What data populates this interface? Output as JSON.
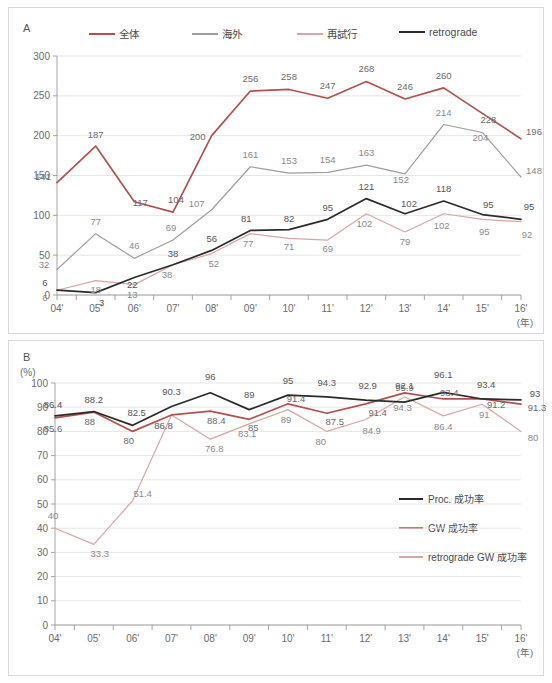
{
  "panelA": {
    "letter": "A",
    "legend": [
      {
        "label": "全体",
        "color": "#b5504e"
      },
      {
        "label": "海外",
        "color": "#9e9e9e"
      },
      {
        "label": "再試行",
        "color": "#d8a7a5"
      },
      {
        "label": "retrograde",
        "color": "#2b2b2b"
      }
    ],
    "axis_unit": "(年)"
  },
  "panelB": {
    "letter": "B",
    "unit": "(%)",
    "legend": [
      {
        "label": "Proc. 成功率",
        "color": "#2b2b2b"
      },
      {
        "label": "GW 成功率",
        "color": "#b5504e"
      },
      {
        "label": "retrograde GW 成功率",
        "color": "#d8a7a5"
      }
    ],
    "axis_unit": "(年)"
  },
  "chart_data": [
    {
      "type": "line",
      "panel": "A",
      "title": "",
      "xlabel": "(年)",
      "ylabel": "",
      "ylim": [
        0,
        300
      ],
      "yticks": [
        0,
        50,
        100,
        150,
        200,
        250,
        300
      ],
      "grid": true,
      "legend_position": "top",
      "categories": [
        "04'",
        "05'",
        "06'",
        "07'",
        "08'",
        "09'",
        "10'",
        "11'",
        "12'",
        "13'",
        "14'",
        "15'",
        "16'"
      ],
      "series": [
        {
          "name": "全体",
          "color": "#b5504e",
          "values": [
            141,
            187,
            117,
            104,
            200,
            256,
            258,
            247,
            268,
            246,
            260,
            228,
            196
          ]
        },
        {
          "name": "海外",
          "color": "#9e9e9e",
          "values": [
            32,
            77,
            46,
            69,
            107,
            161,
            153,
            154,
            163,
            152,
            214,
            204,
            148
          ]
        },
        {
          "name": "再試行",
          "color": "#d8a7a5",
          "values": [
            6,
            18,
            13,
            38,
            52,
            77,
            71,
            69,
            102,
            79,
            102,
            95,
            92
          ]
        },
        {
          "name": "retrograde",
          "color": "#2b2b2b",
          "values": [
            6,
            3,
            22,
            38,
            56,
            81,
            82,
            95,
            121,
            102,
            118,
            101,
            95
          ]
        }
      ],
      "labels": {
        "全体": [
          "141",
          "187",
          "117",
          "104",
          "200",
          "256",
          "258",
          "247",
          "268",
          "246",
          "260",
          "228",
          "196"
        ],
        "海外": [
          "32",
          "77",
          "46",
          "69",
          "107",
          "161",
          "153",
          "154",
          "163",
          "152",
          "214",
          "204",
          "148"
        ],
        "再試行": [
          "6",
          "18",
          "13",
          "38",
          "52",
          "77",
          "71",
          "69",
          "102",
          "79",
          "102",
          "95",
          "92"
        ],
        "retrograde": [
          "6",
          "3",
          "22",
          "38",
          "56",
          "81",
          "82",
          "95",
          "121",
          "102",
          "118",
          "95",
          "95"
        ]
      }
    },
    {
      "type": "line",
      "panel": "B",
      "title": "",
      "xlabel": "(年)",
      "ylabel": "(%)",
      "ylim": [
        0,
        100
      ],
      "yticks": [
        0,
        10,
        20,
        30,
        40,
        50,
        60,
        70,
        80,
        90,
        100
      ],
      "grid": true,
      "legend_position": "inside-right",
      "categories": [
        "04'",
        "05'",
        "06'",
        "07'",
        "08'",
        "09'",
        "10'",
        "11'",
        "12'",
        "13'",
        "14'",
        "15'",
        "16'"
      ],
      "series": [
        {
          "name": "Proc. 成功率",
          "color": "#2b2b2b",
          "values": [
            86.4,
            88.2,
            82.5,
            90.3,
            96,
            89,
            95,
            94.3,
            92.9,
            92.1,
            96.1,
            93.4,
            93
          ]
        },
        {
          "name": "GW 成功率",
          "color": "#b5504e",
          "values": [
            85.6,
            88,
            80,
            86.8,
            88.4,
            85,
            91.4,
            87.5,
            91.4,
            95.9,
            93.4,
            93.4,
            91.3
          ]
        },
        {
          "name": "retrograde GW 成功率",
          "color": "#d8a7a5",
          "values": [
            40,
            33.3,
            51.4,
            86.8,
            76.8,
            83.1,
            89,
            80,
            84.9,
            94.3,
            86.4,
            91.2,
            80
          ]
        }
      ],
      "labels": {
        "Proc. 成功率": [
          "86.4",
          "88.2",
          "82.5",
          "90.3",
          "96",
          "89",
          "95",
          "94.3",
          "92.9",
          "92.1",
          "96.1",
          "93.4",
          "93"
        ],
        "GW 成功率": [
          "85.6",
          "88",
          "80",
          "86.8",
          "88.4",
          "85",
          "91.4",
          "87.5",
          "91.4",
          "95.9",
          "93.4",
          "91.2",
          "91.3"
        ],
        "retrograde GW 成功率": [
          "40",
          "33.3",
          "51.4",
          "86.8",
          "76.8",
          "83.1",
          "89",
          "80",
          "84.9",
          "94.3",
          "86.4",
          "91",
          "80"
        ]
      }
    }
  ]
}
